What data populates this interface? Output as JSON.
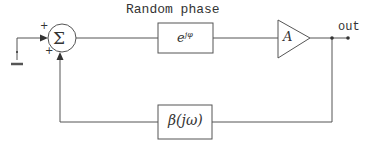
{
  "diagram": {
    "title": "Random phase",
    "output_label": "out",
    "summer": {
      "symbol": "Σ",
      "input_signs": [
        "+",
        "+"
      ]
    },
    "phase_block": {
      "base": "e",
      "exponent": "jφ"
    },
    "amplifier": {
      "label": "A"
    },
    "feedback_block": {
      "label": "β(jω)"
    },
    "colors": {
      "line": "#555555",
      "text": "#333333",
      "background": "#ffffff"
    }
  }
}
